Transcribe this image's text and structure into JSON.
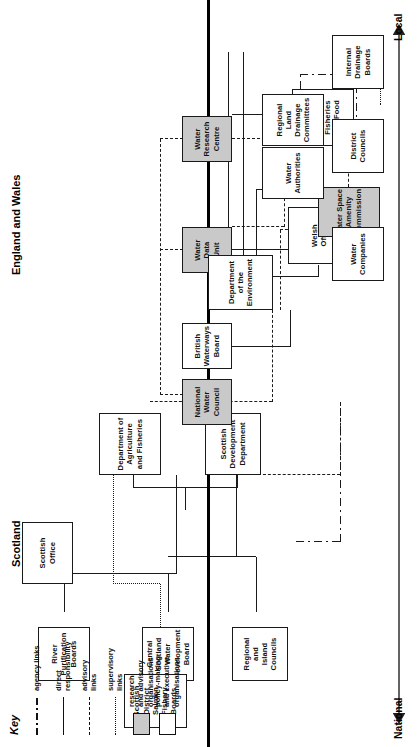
{
  "diagram": {
    "key": {
      "title": "Key",
      "entries": [
        {
          "style": "dashdot",
          "label": "agency links"
        },
        {
          "style": "solid",
          "label": "direct\nresponsibility"
        },
        {
          "style": "dashed",
          "label": "advisory\nlinks"
        },
        {
          "style": "dotted",
          "label": "supervisory\nlinks"
        }
      ],
      "swatches": [
        {
          "fill": "grey",
          "label": "research\nand advisory\norganisations"
        },
        {
          "fill": "white",
          "label": "policy-making\nand executive\norganisations"
        }
      ]
    },
    "sections": {
      "scotland": "Scotland",
      "england_and_wales": "England and Wales"
    },
    "axis": {
      "left": "National",
      "right": "Local"
    },
    "boxes": {
      "scottish_office": "Scottish\nOffice",
      "dept_agriculture_fisheries": "Department of\nAgriculture\nand Fisheries",
      "scottish_development_department": "Scottish\nDevelopment\nDepartment",
      "river_purification_boards": "River\nPurification\nBoards",
      "central_scotland_water_development_board": "Central\nScotland\nWater\nDevelopment\nBoard",
      "regional_and_island_councils": "Regional\nand\nIsland\nCouncils",
      "scottish_district_salmon_fishery_boards": "Scottish\nDistrict\nSalmon\nFishery\nBoards",
      "national_water_council": "National\nWater\nCouncil",
      "british_waterways_board": "British\nWaterways\nBoard",
      "water_data_unit": "Water\nData\nUnit",
      "water_research_centre": "Water\nResearch\nCentre",
      "department_of_the_environment": "Department\nof the\nEnvironment",
      "welsh_office": "Welsh\nOffice",
      "water_space_amenity_commission": "Water Space\nAmenity\nCommission",
      "ministry_of_agriculture": "Ministry of\nAgriculture,\nFisheries\nand Food",
      "water_authorities": "Water\nAuthorities",
      "water_companies": "Water\nCompanies",
      "district_councils": "District\nCouncils",
      "regional_land_drainage_committees": "Regional\nLand\nDrainage\nCommittees",
      "internal_drainage_boards": "Internal\nDrainage\nBoards"
    },
    "colors": {
      "research_fill": "#c9c9c9",
      "executive_fill": "#ffffff",
      "line": "#1a1a1a",
      "background": "#ffffff"
    }
  }
}
